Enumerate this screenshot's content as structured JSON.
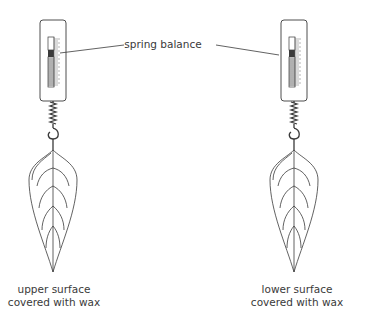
{
  "diagram": {
    "callout_label": "spring balance",
    "left": {
      "caption_line1": "upper surface",
      "caption_line2": "covered with wax"
    },
    "right": {
      "caption_line1": "lower surface",
      "caption_line2": "covered with wax"
    },
    "colors": {
      "line": "#3a3a3a",
      "text": "#3a3a3a",
      "background": "#ffffff"
    },
    "icons": [
      "spring-balance-icon",
      "spring-icon",
      "hook-icon",
      "leaf-icon"
    ]
  }
}
